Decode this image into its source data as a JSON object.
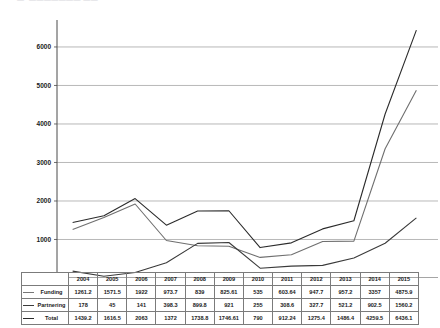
{
  "top_artifact": "   —  ——————— ——",
  "chart_data": {
    "type": "line",
    "title": "",
    "xlabel": "",
    "ylabel": "",
    "ylim": [
      0,
      6700
    ],
    "yticks": [
      0,
      1000,
      2000,
      3000,
      4000,
      5000,
      6000
    ],
    "ytick_labels": [
      "0",
      "1000",
      "2000",
      "3000",
      "4000",
      "5000",
      "6000"
    ],
    "grid": true,
    "legend": "table-row-labels",
    "categories": [
      "2004",
      "2005",
      "2006",
      "2007",
      "2008",
      "2009",
      "2010",
      "2011",
      "2012",
      "2013",
      "2014",
      "2015"
    ],
    "series": [
      {
        "name": "Funding",
        "color": "#6f6f6f",
        "values": [
          1261.2,
          1571.5,
          1922,
          973.7,
          839,
          825.61,
          535,
          603.64,
          947.7,
          957.2,
          3357,
          4875.9
        ]
      },
      {
        "name": "Partnering",
        "color": "#3a3a3a",
        "values": [
          178,
          45,
          141,
          398.3,
          899.8,
          921,
          255,
          308.6,
          327.7,
          521.2,
          902.5,
          1560.2
        ]
      },
      {
        "name": "Total",
        "color": "#2b2b2b",
        "values": [
          1439.2,
          1616.5,
          2063,
          1372,
          1738.8,
          1746.61,
          790,
          912.24,
          1275.4,
          1486.4,
          4259.5,
          6436.1
        ]
      }
    ]
  },
  "table": {
    "corner_label": "",
    "columns": [
      "2004",
      "2005",
      "2006",
      "2007",
      "2008",
      "2009",
      "2010",
      "2011",
      "2012",
      "2013",
      "2014",
      "2015"
    ],
    "rows": [
      {
        "label": "Funding",
        "swatch_class": "funding",
        "cells": [
          "1261.2",
          "1571.5",
          "1922",
          "973.7",
          "839",
          "825.61",
          "535",
          "603.64",
          "947.7",
          "957.2",
          "3357",
          "4875.9"
        ]
      },
      {
        "label": "Partnering",
        "swatch_class": "partnering",
        "cells": [
          "178",
          "45",
          "141",
          "398.3",
          "899.8",
          "921",
          "255",
          "308.6",
          "327.7",
          "521.2",
          "902.5",
          "1560.2"
        ]
      },
      {
        "label": "Total",
        "swatch_class": "total",
        "cells": [
          "1439.2",
          "1616.5",
          "2063",
          "1372",
          "1738.8",
          "1746.61",
          "790",
          "912.24",
          "1275.4",
          "1486.4",
          "4259.5",
          "6436.1"
        ]
      }
    ]
  }
}
